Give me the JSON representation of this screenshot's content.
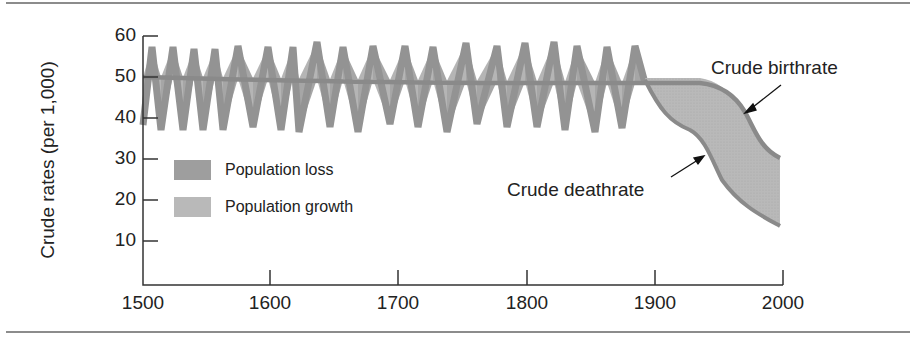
{
  "chart_data": {
    "type": "area",
    "title": "",
    "xlabel": "",
    "ylabel": "Crude rates (per 1,000)",
    "xlim": [
      1500,
      2000
    ],
    "ylim": [
      0,
      60
    ],
    "x_ticks": [
      "1500",
      "1600",
      "1700",
      "1800",
      "1900",
      "2000"
    ],
    "y_ticks": [
      "60",
      "50",
      "40",
      "30",
      "20",
      "10"
    ],
    "grid": false,
    "legend": [
      {
        "label": "Population loss",
        "color": "#9c9c9c"
      },
      {
        "label": "Population growth",
        "color": "#b8b8b8"
      }
    ],
    "annotations": [
      {
        "text": "Crude birthrate",
        "points_to": "birthrate curve near 1965"
      },
      {
        "text": "Crude deathrate",
        "points_to": "deathrate curve near 1945"
      }
    ],
    "series": [
      {
        "name": "Crude birthrate",
        "x": [
          1500,
          1550,
          1600,
          1650,
          1700,
          1750,
          1800,
          1850,
          1900,
          1930,
          1945,
          1960,
          1970,
          1980,
          1990,
          2000
        ],
        "values": [
          50,
          49.5,
          49,
          48.5,
          48,
          48,
          48,
          48,
          48,
          48,
          47,
          43,
          39,
          35,
          32,
          30
        ]
      },
      {
        "name": "Crude deathrate",
        "x": [
          1500,
          1510,
          1520,
          1530,
          1540,
          1550,
          1560,
          1570,
          1580,
          1590,
          1600,
          1620,
          1640,
          1660,
          1680,
          1700,
          1720,
          1740,
          1760,
          1780,
          1800,
          1820,
          1840,
          1860,
          1880,
          1895,
          1900,
          1910,
          1920,
          1930,
          1940,
          1950,
          1960,
          1980,
          2000
        ],
        "values": [
          42,
          57,
          42,
          57,
          42,
          56,
          42,
          57,
          43,
          57,
          42,
          57,
          43,
          57,
          43,
          57,
          43,
          58,
          43,
          57,
          43,
          58,
          43,
          56,
          43,
          56,
          48,
          42,
          37,
          35,
          33,
          28,
          24,
          18,
          14
        ],
        "note": "Pre-1900 deathrate oscillates sharply around birthrate (approx. 42–58); after 1900 it falls steadily to ~14 by 2000"
      }
    ]
  },
  "labels": {
    "ylabel": "Crude rates (per 1,000)",
    "legend_loss": "Population loss",
    "legend_growth": "Population growth",
    "birthrate": "Crude birthrate",
    "deathrate": "Crude deathrate"
  }
}
